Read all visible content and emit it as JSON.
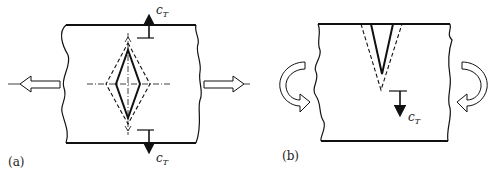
{
  "figure": {
    "panels": [
      {
        "id": "a",
        "label": "(a)",
        "description": "Plate with central diamond-shaped crack under tension; dashed outline shows crack extension, arrows c_T show crack growth up and down",
        "top_annotation": {
          "symbol": "c",
          "subscript": "T"
        },
        "bottom_annotation": {
          "symbol": "c",
          "subscript": "T"
        },
        "load": "tension (hollow arrows left and right)"
      },
      {
        "id": "b",
        "label": "(b)",
        "description": "Plate with surface V-notch crack under bending; dashed outline shows crack extension, arrow c_T shows growth downward",
        "annotation": {
          "symbol": "c",
          "subscript": "T"
        },
        "load": "bending (curved hollow arrows)"
      }
    ],
    "colors": {
      "stroke": "#111111",
      "background": "#ffffff"
    }
  }
}
